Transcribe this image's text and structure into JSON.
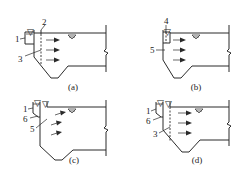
{
  "figure": {
    "panels": [
      {
        "caption": "(a)",
        "labels": [
          "1",
          "2",
          "3"
        ],
        "parts": [
          "trough box",
          "inlet wall",
          "perforated baffle (dashed)"
        ]
      },
      {
        "caption": "(b)",
        "labels": [
          "4",
          "5"
        ],
        "parts": [
          "small trough",
          "inlet wall"
        ]
      },
      {
        "caption": "(c)",
        "labels": [
          "1",
          "6",
          "5"
        ],
        "parts": [
          "trough box",
          "orifice",
          "inlet wall"
        ]
      },
      {
        "caption": "(d)",
        "labels": [
          "1",
          "6",
          "3"
        ],
        "parts": [
          "trough box",
          "orifice",
          "perforated baffle (dashed)"
        ]
      }
    ],
    "flow_arrows_per_panel": 3,
    "water_surface_symbol": "▽"
  }
}
